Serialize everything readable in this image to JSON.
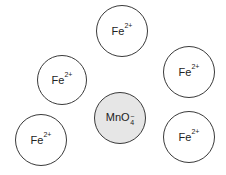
{
  "diagram": {
    "type": "ion-arrangement",
    "colors": {
      "stroke": "#3a3a3a",
      "anion_fill": "#e6e6e6",
      "cation_fill": "#ffffff"
    },
    "ions": [
      {
        "id": "fe-top",
        "base": "Fe",
        "charge": "2+",
        "cx": 122,
        "cy": 31,
        "r": 26
      },
      {
        "id": "fe-upper-left",
        "base": "Fe",
        "charge": "2+",
        "cx": 62,
        "cy": 80,
        "r": 25
      },
      {
        "id": "fe-upper-right",
        "base": "Fe",
        "charge": "2+",
        "cx": 189,
        "cy": 72,
        "r": 26
      },
      {
        "id": "mno4",
        "base": "MnO",
        "subscript": "4",
        "charge": "−",
        "cx": 120,
        "cy": 118,
        "r": 26
      },
      {
        "id": "fe-lower-left",
        "base": "Fe",
        "charge": "2+",
        "cx": 41,
        "cy": 140,
        "r": 26
      },
      {
        "id": "fe-lower-right",
        "base": "Fe",
        "charge": "2+",
        "cx": 189,
        "cy": 137,
        "r": 26
      }
    ]
  }
}
